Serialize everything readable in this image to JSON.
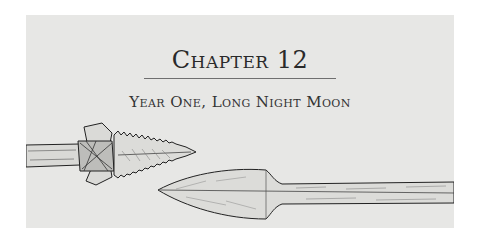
{
  "chapter": {
    "title": "Chapter 12",
    "subtitle": "Year One, Long Night Moon"
  },
  "illustrations": [
    {
      "name": "serrated-spearhead-left",
      "description": "bound serrated stone spear point on wooden shaft"
    },
    {
      "name": "leaf-spearhead-right",
      "description": "leaf-shaped spear point on long shaft"
    }
  ],
  "colors": {
    "page": "#ffffff",
    "panel": "#e7e7e5",
    "ink": "#2a2a2a",
    "rule": "#6f6f6f"
  }
}
